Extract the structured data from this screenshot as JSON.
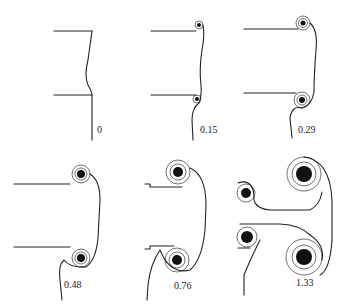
{
  "figure": {
    "panels": [
      {
        "id": "p0",
        "time_label": "0"
      },
      {
        "id": "p1",
        "time_label": "0.15"
      },
      {
        "id": "p2",
        "time_label": "0.29"
      },
      {
        "id": "p3",
        "time_label": "0.48"
      },
      {
        "id": "p4",
        "time_label": "0.76"
      },
      {
        "id": "p5",
        "time_label": "1.33"
      }
    ],
    "colors": {
      "ink": "#222222",
      "background": "#ffffff"
    }
  }
}
